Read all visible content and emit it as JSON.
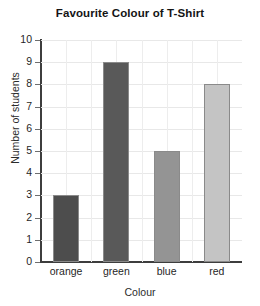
{
  "chart_data": {
    "type": "bar",
    "title": "Favourite Colour of T-Shirt",
    "xlabel": "Colour",
    "ylabel": "Number of students",
    "categories": [
      "orange",
      "green",
      "blue",
      "red"
    ],
    "values": [
      3,
      9,
      5,
      8
    ],
    "ylim": [
      0,
      10
    ],
    "ytick_labels": [
      "0",
      "1",
      "2",
      "3",
      "4",
      "5",
      "6",
      "7",
      "8",
      "9",
      "10"
    ],
    "ytick_values": [
      0,
      1,
      2,
      3,
      4,
      5,
      6,
      7,
      8,
      9,
      10
    ],
    "grid": true,
    "legend": "none",
    "bar_colors": [
      "#4d4d4d",
      "#595959",
      "#949494",
      "#c4c4c4"
    ],
    "bar_edge_color": "#8a8a8a",
    "grid_color": "#e8e8e8",
    "axis_color": "#3d3d3d",
    "background": "#ffffff"
  }
}
